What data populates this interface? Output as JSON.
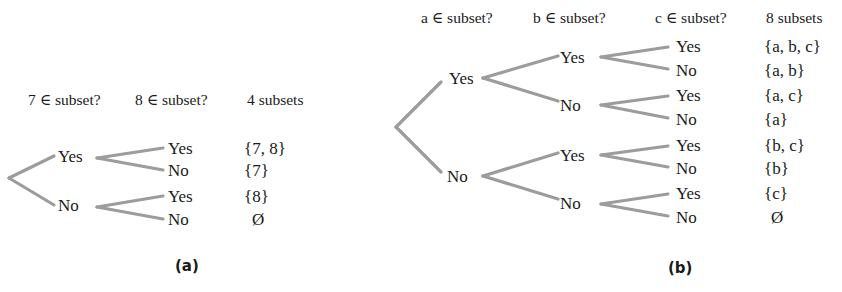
{
  "panel_a": {
    "caption": "(a)",
    "headers": [
      "7 ∈ subset?",
      "8 ∈ subset?",
      "4 subsets"
    ],
    "level1": [
      "Yes",
      "No"
    ],
    "level2": [
      "Yes",
      "No",
      "Yes",
      "No"
    ],
    "subsets": [
      "{7, 8}",
      "{7}",
      "{8}",
      "Ø"
    ]
  },
  "panel_b": {
    "caption": "(b)",
    "headers": [
      "a ∈ subset?",
      "b ∈ subset?",
      "c ∈ subset?",
      "8 subsets"
    ],
    "level1": [
      "Yes",
      "No"
    ],
    "level2": [
      "Yes",
      "No",
      "Yes",
      "No"
    ],
    "level3": [
      "Yes",
      "No",
      "Yes",
      "No",
      "Yes",
      "No",
      "Yes",
      "No"
    ],
    "subsets": [
      "{a, b, c}",
      "{a, b}",
      "{a, c}",
      "{a}",
      "{b, c}",
      "{b}",
      "{c}",
      "Ø"
    ]
  },
  "colors": {
    "branch": "#9c9c9c",
    "text": "#1a1a1a"
  }
}
